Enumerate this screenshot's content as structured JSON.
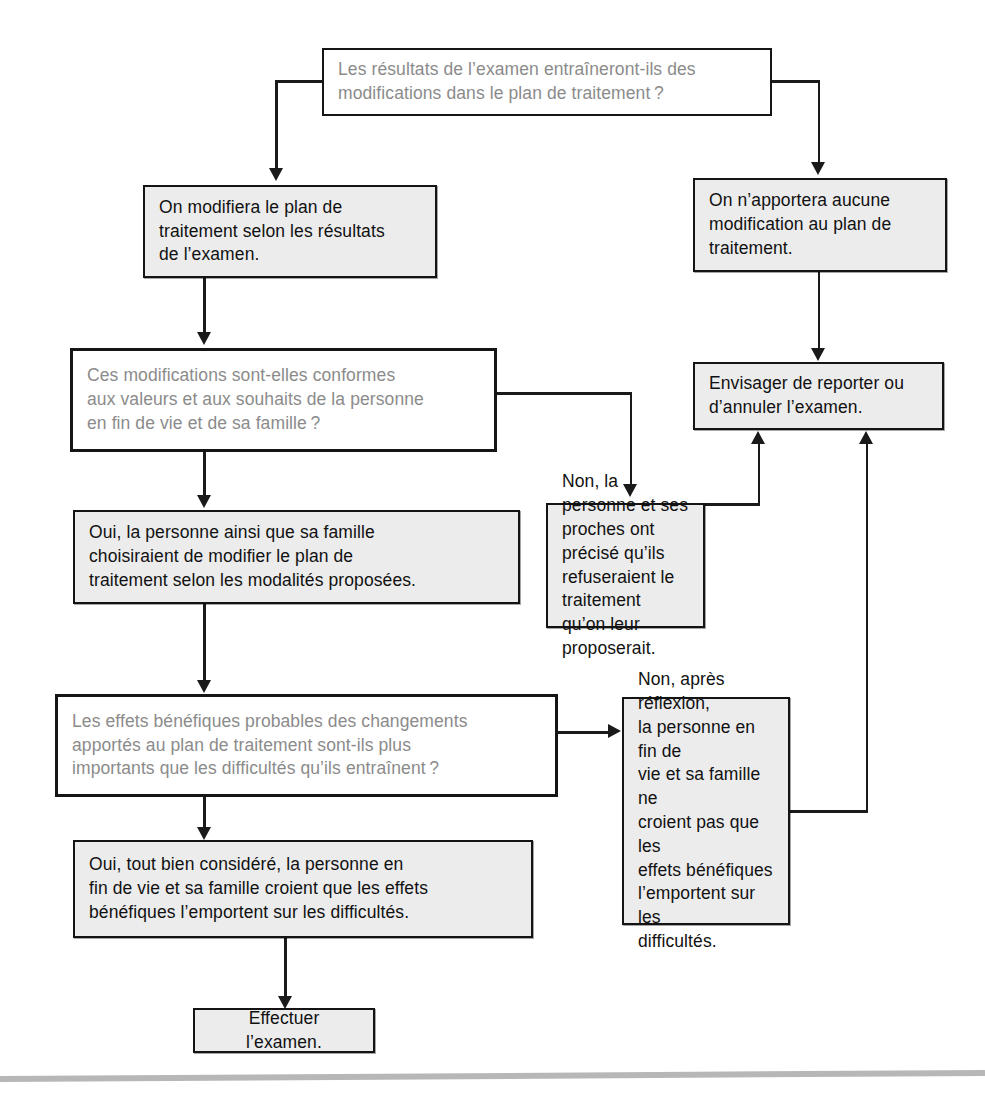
{
  "diagram": {
    "colors": {
      "question_text": "#8b8b8b",
      "answer_text": "#111111",
      "answer_fill": "#ececed",
      "question_fill": "#ffffff",
      "stroke": "#1a1a1a",
      "page_rule": "#b7b7b7"
    },
    "nodes": {
      "q_modifications": "Les résultats de l’examen entraîneront-ils des\nmodifications dans le plan de traitement ?",
      "a_modifiera": "On modifiera le plan de\ntraitement selon les résultats\nde l’examen.",
      "a_aucune_modification": "On n’apportera aucune\nmodification au plan de\ntraitement.",
      "q_conformes": "Ces modifications sont-elles conformes\naux valeurs et aux souhaits de la personne\nen fin de vie et de sa famille ?",
      "a_envisager": "Envisager de reporter ou\nd’annuler l’examen.",
      "a_oui_choisiraient": "Oui, la personne ainsi que sa famille\nchoisiraient de modifier le plan de\ntraitement selon les modalités proposées.",
      "a_non_refuseraient": "Non, la personne et ses\nproches ont précisé qu’ils\nrefuseraient le traitement\nqu’on leur proposerait.",
      "q_effets_benefiques": "Les effets bénéfiques probables des changements\napportés au plan de traitement sont-ils plus\nimportants que les difficultés qu’ils entraînent ?",
      "a_non_apres_reflexion": "Non, après réflexion,\nla personne en fin de\nvie et sa famille ne\ncroient pas que les\neffets bénéfiques\nl’emportent sur les\ndifficultés.",
      "a_oui_tout_bien": "Oui, tout bien considéré, la personne en\nfin de vie et sa famille croient que les effets\nbénéfiques l’emportent sur les difficultés.",
      "a_effectuer": "Effectuer l’examen."
    }
  }
}
